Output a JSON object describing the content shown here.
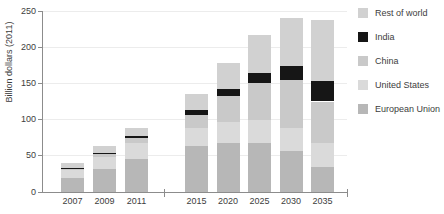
{
  "chart_data": {
    "type": "bar",
    "stacked": true,
    "title": "",
    "ylabel": "Billion dollars (2011)",
    "ylim": [
      0,
      250
    ],
    "ystep": 50,
    "grid": true,
    "legend_position": "right",
    "axis_break_between": [
      "2011",
      "2015"
    ],
    "categories": [
      "2007",
      "2009",
      "2011",
      "2015",
      "2020",
      "2025",
      "2030",
      "2035"
    ],
    "category_groups": [
      [
        "2007",
        "2009",
        "2011"
      ],
      [
        "2015",
        "2020",
        "2025",
        "2030",
        "2035"
      ]
    ],
    "series": [
      {
        "name": "European Union",
        "color": "#b7b7b7",
        "values": [
          19,
          32,
          45,
          63,
          67,
          68,
          56,
          35
        ]
      },
      {
        "name": "United States",
        "color": "#dadada",
        "values": [
          11,
          16,
          23,
          25,
          30,
          32,
          33,
          32
        ]
      },
      {
        "name": "China",
        "color": "#c9c9c9",
        "values": [
          2,
          4,
          7,
          19,
          35,
          50,
          66,
          58
        ]
      },
      {
        "name": "India",
        "color": "#161616",
        "values": [
          0.5,
          2,
          3,
          6,
          10,
          14,
          19,
          28
        ]
      },
      {
        "name": "Rest of world",
        "color": "#d1d1d1",
        "values": [
          7.5,
          9,
          10,
          23,
          36,
          53,
          66,
          84
        ]
      }
    ],
    "legend_order": [
      "Rest of world",
      "India",
      "China",
      "United States",
      "European Union"
    ]
  }
}
